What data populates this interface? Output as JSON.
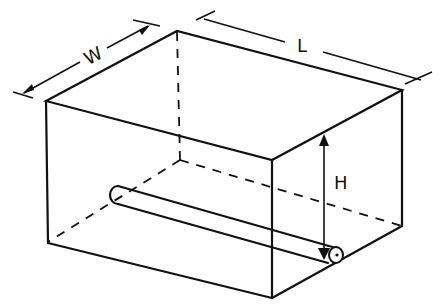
{
  "diagram": {
    "type": "isometric-box-with-pipe",
    "labels": {
      "width": "W",
      "length": "L",
      "height": "H"
    },
    "colors": {
      "line": "#111111",
      "background": "#ffffff"
    }
  }
}
